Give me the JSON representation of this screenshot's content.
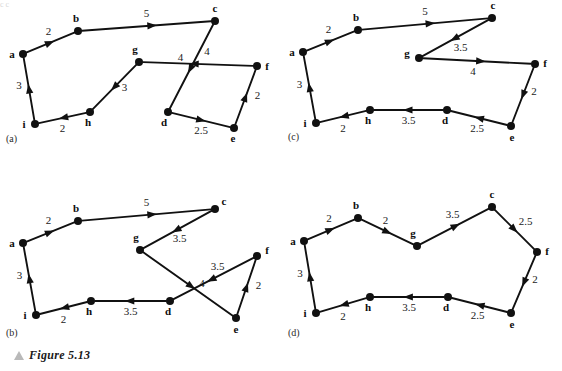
{
  "figure": {
    "caption": "Figure 5.13",
    "caption_marker": "triangle-up-icon",
    "panels": [
      {
        "id": "a",
        "tag": "(a)"
      },
      {
        "id": "b",
        "tag": "(b)"
      },
      {
        "id": "c",
        "tag": "(c)"
      },
      {
        "id": "d",
        "tag": "(d)"
      }
    ]
  },
  "graphs": {
    "a": {
      "tag": "(a)",
      "nodes": [
        {
          "id": "a",
          "label": "a",
          "x": 23,
          "y": 54,
          "lx": -11,
          "ly": 4
        },
        {
          "id": "b",
          "label": "b",
          "x": 78,
          "y": 31,
          "lx": -2,
          "ly": -9
        },
        {
          "id": "c",
          "label": "c",
          "x": 215,
          "y": 21,
          "lx": 0,
          "ly": -9
        },
        {
          "id": "d",
          "label": "d",
          "x": 168,
          "y": 112,
          "lx": -4,
          "ly": 14
        },
        {
          "id": "e",
          "label": "e",
          "x": 234,
          "y": 128,
          "lx": -1,
          "ly": 14
        },
        {
          "id": "f",
          "label": "f",
          "x": 257,
          "y": 66,
          "lx": 10,
          "ly": 4
        },
        {
          "id": "g",
          "label": "g",
          "x": 139,
          "y": 62,
          "lx": -4,
          "ly": -9
        },
        {
          "id": "h",
          "label": "h",
          "x": 90,
          "y": 112,
          "lx": -2,
          "ly": 14
        },
        {
          "id": "i",
          "label": "i",
          "x": 35,
          "y": 124,
          "lx": -11,
          "ly": 4
        }
      ],
      "edges": [
        {
          "from": "i",
          "to": "a",
          "weight": "3",
          "wx": -10,
          "wy": 0
        },
        {
          "from": "a",
          "to": "b",
          "weight": "2",
          "wx": -2,
          "wy": -8
        },
        {
          "from": "b",
          "to": "c",
          "weight": "5",
          "wx": 0,
          "wy": -9
        },
        {
          "from": "c",
          "to": "d",
          "weight": "4",
          "wx": -11,
          "wy": -6
        },
        {
          "from": "d",
          "to": "e",
          "weight": "2.5",
          "wx": 0,
          "wy": 14
        },
        {
          "from": "e",
          "to": "f",
          "weight": "2",
          "wx": 12,
          "wy": 2
        },
        {
          "from": "f",
          "to": "g",
          "weight": "4",
          "wx": 9,
          "wy": -9
        },
        {
          "from": "g",
          "to": "h",
          "weight": "3",
          "wx": 10,
          "wy": 4
        },
        {
          "from": "h",
          "to": "i",
          "weight": "2",
          "wx": 0,
          "wy": 14
        }
      ]
    },
    "b": {
      "tag": "(b)",
      "nodes": [
        {
          "id": "a",
          "label": "a",
          "x": 23,
          "y": 243,
          "lx": -11,
          "ly": 4
        },
        {
          "id": "b",
          "label": "b",
          "x": 78,
          "y": 221,
          "lx": -2,
          "ly": -9
        },
        {
          "id": "c",
          "label": "c",
          "x": 215,
          "y": 209,
          "lx": 9,
          "ly": -4
        },
        {
          "id": "d",
          "label": "d",
          "x": 170,
          "y": 301,
          "lx": -2,
          "ly": 14
        },
        {
          "id": "e",
          "label": "e",
          "x": 236,
          "y": 318,
          "lx": 0,
          "ly": 15
        },
        {
          "id": "f",
          "label": "f",
          "x": 257,
          "y": 256,
          "lx": 10,
          "ly": -2
        },
        {
          "id": "g",
          "label": "g",
          "x": 140,
          "y": 250,
          "lx": -4,
          "ly": -9
        },
        {
          "id": "h",
          "label": "h",
          "x": 91,
          "y": 301,
          "lx": -2,
          "ly": 14
        },
        {
          "id": "i",
          "label": "i",
          "x": 36,
          "y": 315,
          "lx": -11,
          "ly": 4
        }
      ],
      "edges": [
        {
          "from": "i",
          "to": "a",
          "weight": "3",
          "wx": -10,
          "wy": 0
        },
        {
          "from": "a",
          "to": "b",
          "weight": "2",
          "wx": -2,
          "wy": -8
        },
        {
          "from": "b",
          "to": "c",
          "weight": "5",
          "wx": 0,
          "wy": -9
        },
        {
          "from": "c",
          "to": "g",
          "weight": "3.5",
          "wx": 2,
          "wy": 12
        },
        {
          "from": "g",
          "to": "e",
          "weight": "4",
          "wx": 14,
          "wy": 3
        },
        {
          "from": "e",
          "to": "f",
          "weight": "2",
          "wx": 12,
          "wy": 2
        },
        {
          "from": "f",
          "to": "d",
          "weight": "3.5",
          "wx": 4,
          "wy": -9
        },
        {
          "from": "d",
          "to": "h",
          "weight": "3.5",
          "wx": 0,
          "wy": 14
        },
        {
          "from": "h",
          "to": "i",
          "weight": "2",
          "wx": 0,
          "wy": 15
        }
      ]
    },
    "c": {
      "tag": "(c)",
      "nodes": [
        {
          "id": "a",
          "label": "a",
          "x": 303,
          "y": 52,
          "lx": -11,
          "ly": 4
        },
        {
          "id": "b",
          "label": "b",
          "x": 358,
          "y": 30,
          "lx": -2,
          "ly": -9
        },
        {
          "id": "c",
          "label": "c",
          "x": 492,
          "y": 18,
          "lx": 1,
          "ly": -9
        },
        {
          "id": "d",
          "label": "d",
          "x": 447,
          "y": 110,
          "lx": -2,
          "ly": 14
        },
        {
          "id": "e",
          "label": "e",
          "x": 511,
          "y": 126,
          "lx": 1,
          "ly": 15
        },
        {
          "id": "f",
          "label": "f",
          "x": 535,
          "y": 64,
          "lx": 10,
          "ly": 3
        },
        {
          "id": "g",
          "label": "g",
          "x": 419,
          "y": 58,
          "lx": -12,
          "ly": -1
        },
        {
          "id": "h",
          "label": "h",
          "x": 370,
          "y": 110,
          "lx": -2,
          "ly": 14
        },
        {
          "id": "i",
          "label": "i",
          "x": 316,
          "y": 123,
          "lx": -11,
          "ly": 4
        }
      ],
      "edges": [
        {
          "from": "i",
          "to": "a",
          "weight": "3",
          "wx": -10,
          "wy": 0
        },
        {
          "from": "a",
          "to": "b",
          "weight": "2",
          "wx": -2,
          "wy": -8
        },
        {
          "from": "b",
          "to": "c",
          "weight": "5",
          "wx": 0,
          "wy": -9
        },
        {
          "from": "c",
          "to": "g",
          "weight": "3.5",
          "wx": 5,
          "wy": 13
        },
        {
          "from": "g",
          "to": "f",
          "weight": "4",
          "wx": -4,
          "wy": 14
        },
        {
          "from": "f",
          "to": "e",
          "weight": "2",
          "wx": 11,
          "wy": 0
        },
        {
          "from": "e",
          "to": "d",
          "weight": "2.5",
          "wx": -2,
          "wy": 14
        },
        {
          "from": "d",
          "to": "h",
          "weight": "3.5",
          "wx": 0,
          "wy": 14
        },
        {
          "from": "h",
          "to": "i",
          "weight": "2",
          "wx": 0,
          "wy": 15
        }
      ]
    },
    "d": {
      "tag": "(d)",
      "nodes": [
        {
          "id": "a",
          "label": "a",
          "x": 304,
          "y": 241,
          "lx": -11,
          "ly": 4
        },
        {
          "id": "b",
          "label": "b",
          "x": 358,
          "y": 218,
          "lx": -2,
          "ly": -9
        },
        {
          "id": "c",
          "label": "c",
          "x": 492,
          "y": 207,
          "lx": 0,
          "ly": -9
        },
        {
          "id": "d",
          "label": "d",
          "x": 448,
          "y": 297,
          "lx": -2,
          "ly": 14
        },
        {
          "id": "e",
          "label": "e",
          "x": 511,
          "y": 313,
          "lx": 1,
          "ly": 15
        },
        {
          "id": "f",
          "label": "f",
          "x": 537,
          "y": 252,
          "lx": 10,
          "ly": 3
        },
        {
          "id": "g",
          "label": "g",
          "x": 417,
          "y": 246,
          "lx": -4,
          "ly": -9
        },
        {
          "id": "h",
          "label": "h",
          "x": 370,
          "y": 297,
          "lx": -2,
          "ly": 14
        },
        {
          "id": "i",
          "label": "i",
          "x": 316,
          "y": 313,
          "lx": -11,
          "ly": 4
        }
      ],
      "edges": [
        {
          "from": "i",
          "to": "a",
          "weight": "3",
          "wx": -10,
          "wy": 0
        },
        {
          "from": "a",
          "to": "b",
          "weight": "2",
          "wx": -2,
          "wy": -8
        },
        {
          "from": "b",
          "to": "g",
          "weight": "2",
          "wx": -2,
          "wy": -8
        },
        {
          "from": "g",
          "to": "c",
          "weight": "3.5",
          "wx": -2,
          "wy": -9
        },
        {
          "from": "c",
          "to": "f",
          "weight": "2.5",
          "wx": 11,
          "wy": -5
        },
        {
          "from": "f",
          "to": "e",
          "weight": "2",
          "wx": 11,
          "wy": 0
        },
        {
          "from": "e",
          "to": "d",
          "weight": "2.5",
          "wx": -2,
          "wy": 14
        },
        {
          "from": "d",
          "to": "h",
          "weight": "3.5",
          "wx": 0,
          "wy": 14
        },
        {
          "from": "h",
          "to": "i",
          "weight": "2",
          "wx": 0,
          "wy": 15
        }
      ]
    }
  },
  "panel_tags": {
    "a": {
      "text": "(a)",
      "x": 6,
      "y": 142
    },
    "b": {
      "text": "(b)",
      "x": 6,
      "y": 336
    },
    "c": {
      "text": "(c)",
      "x": 288,
      "y": 140
    },
    "d": {
      "text": "(d)",
      "x": 288,
      "y": 336
    }
  },
  "top_bleed_text": "c                                                c"
}
